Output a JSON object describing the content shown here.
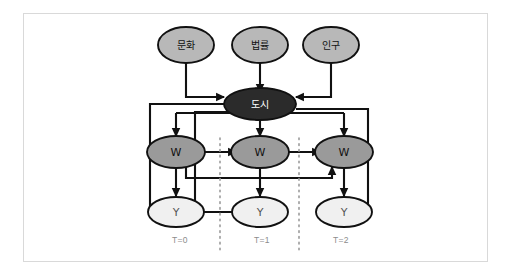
{
  "figure": {
    "background_color": "#ffffff",
    "frame_border_color": "#d9d9d9"
  },
  "colors": {
    "exogenous_fill": "#b8b8b8",
    "city_fill": "#2b2b2b",
    "city_text": "#ffffff",
    "w_fill": "#9a9a9a",
    "y_fill": "#f0f0f0",
    "node_stroke": "#111111",
    "edge_color": "#111111",
    "time_label_color": "#8c8c8c",
    "separator_color": "#9a9a9a"
  },
  "nodes": {
    "exogenous": [
      {
        "id": "culture",
        "label": "문화"
      },
      {
        "id": "law",
        "label": "법률"
      },
      {
        "id": "population",
        "label": "인구"
      }
    ],
    "hub": {
      "id": "city",
      "label": "도시"
    },
    "w_nodes": [
      {
        "id": "w0",
        "label": "W"
      },
      {
        "id": "w1",
        "label": "W"
      },
      {
        "id": "w2",
        "label": "W"
      }
    ],
    "y_nodes": [
      {
        "id": "y0",
        "label": "Y"
      },
      {
        "id": "y1",
        "label": "Y"
      },
      {
        "id": "y2",
        "label": "Y"
      }
    ]
  },
  "time_slices": [
    {
      "id": "t0",
      "label": "T=0"
    },
    {
      "id": "t1",
      "label": "T=1"
    },
    {
      "id": "t2",
      "label": "T=2"
    }
  ],
  "edges": [
    {
      "from": "culture",
      "to": "city"
    },
    {
      "from": "law",
      "to": "city"
    },
    {
      "from": "population",
      "to": "city"
    },
    {
      "from": "city",
      "to": "w0"
    },
    {
      "from": "city",
      "to": "w1"
    },
    {
      "from": "city",
      "to": "w2"
    },
    {
      "from": "city",
      "to": "y0"
    },
    {
      "from": "city",
      "to": "y1"
    },
    {
      "from": "city",
      "to": "y2"
    },
    {
      "from": "w0",
      "to": "w1"
    },
    {
      "from": "w1",
      "to": "w2"
    },
    {
      "from": "w0",
      "to": "y0"
    },
    {
      "from": "w1",
      "to": "y1"
    },
    {
      "from": "w2",
      "to": "y2"
    },
    {
      "from": "w0",
      "to": "w2"
    }
  ]
}
